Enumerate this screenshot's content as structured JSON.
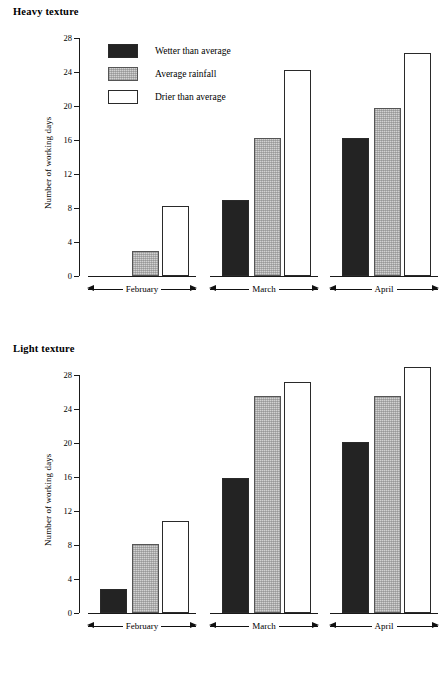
{
  "figure": {
    "panels": [
      {
        "title": "Heavy texture",
        "axis": {
          "ylabel": "Number of working days",
          "yticks": [
            0,
            4,
            8,
            12,
            16,
            20,
            24,
            28
          ]
        },
        "groups": [
          "February",
          "March",
          "April"
        ]
      },
      {
        "title": "Light texture",
        "axis": {
          "ylabel": "Number of working days",
          "yticks": [
            0,
            4,
            8,
            12,
            16,
            20,
            24,
            28
          ]
        },
        "groups": [
          "February",
          "March",
          "April"
        ]
      }
    ],
    "legend": [
      {
        "label": "Wetter than average",
        "swatch": "black",
        "color": "#232323"
      },
      {
        "label": "Average rainfall",
        "swatch": "gray",
        "color": "#d2d2d2"
      },
      {
        "label": "Drier than average",
        "swatch": "white",
        "color": "#ffffff"
      }
    ]
  },
  "chart_data": [
    {
      "type": "bar",
      "title": "Heavy texture",
      "xlabel": "",
      "ylabel": "Number of working days",
      "categories": [
        "February",
        "March",
        "April"
      ],
      "ylim": [
        0,
        28
      ],
      "yticks": [
        0,
        4,
        8,
        12,
        16,
        20,
        24,
        28
      ],
      "grid": false,
      "legend_position": "inside-top-left",
      "series": [
        {
          "name": "Wetter than average",
          "color": "#232323",
          "values": [
            0,
            9.0,
            16.2
          ]
        },
        {
          "name": "Average rainfall",
          "color": "#d2d2d2",
          "values": [
            3.0,
            16.2,
            19.8
          ]
        },
        {
          "name": "Drier than average",
          "color": "#ffffff",
          "values": [
            8.2,
            24.2,
            26.2
          ]
        }
      ]
    },
    {
      "type": "bar",
      "title": "Light texture",
      "xlabel": "",
      "ylabel": "Number of working days",
      "categories": [
        "February",
        "March",
        "April"
      ],
      "ylim": [
        0,
        28
      ],
      "yticks": [
        0,
        4,
        8,
        12,
        16,
        20,
        24,
        28
      ],
      "grid": false,
      "legend_position": "none",
      "series": [
        {
          "name": "Wetter than average",
          "color": "#232323",
          "values": [
            2.8,
            15.9,
            20.1
          ]
        },
        {
          "name": "Average rainfall",
          "color": "#d2d2d2",
          "values": [
            8.1,
            25.5,
            25.5
          ]
        },
        {
          "name": "Drier than average",
          "color": "#ffffff",
          "values": [
            10.8,
            27.2,
            29.0
          ]
        }
      ]
    }
  ]
}
